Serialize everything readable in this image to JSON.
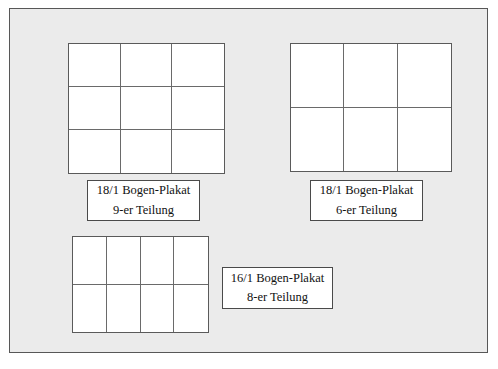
{
  "page": {
    "background_color": "#ebebeb",
    "frame_color": "#575757",
    "figure_fill": "#ffffff",
    "grid_line_color": "#6a6a6a",
    "text_color": "#111111"
  },
  "figures": [
    {
      "id": "9er",
      "name": "poster-sheet-9-division",
      "columns": 3,
      "rows": 3,
      "cells": 9,
      "caption_line1": "18/1 Bogen-Plakat",
      "caption_line2": "9-er Teilung"
    },
    {
      "id": "6er",
      "name": "poster-sheet-6-division",
      "columns": 3,
      "rows": 2,
      "cells": 6,
      "caption_line1": "18/1 Bogen-Plakat",
      "caption_line2": "6-er Teilung"
    },
    {
      "id": "8er",
      "name": "poster-sheet-8-division",
      "columns": 4,
      "rows": 2,
      "cells": 8,
      "caption_line1": "16/1 Bogen-Plakat",
      "caption_line2": "8-er Teilung"
    }
  ]
}
